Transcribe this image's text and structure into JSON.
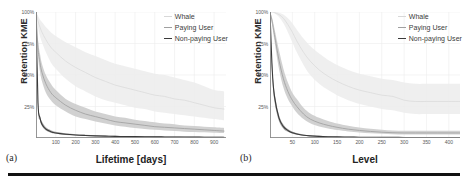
{
  "figure": {
    "background": "#ffffff",
    "rule_color": "#111111"
  },
  "panels": [
    {
      "tag": "(a)",
      "ylabel": "Retention KME",
      "xlabel": "Lifetime [days]"
    },
    {
      "tag": "(b)",
      "ylabel": "Retention KME",
      "xlabel": "Level"
    }
  ],
  "legend": {
    "items": [
      {
        "label": "Whale",
        "color": "#d8d8d8"
      },
      {
        "label": "Paying User",
        "color": "#a0a0a0"
      },
      {
        "label": "Non-paying User",
        "color": "#3a3a3a"
      }
    ]
  },
  "chart_data": [
    {
      "type": "line",
      "title": "",
      "panel": "(a)",
      "xlabel": "Lifetime [days]",
      "ylabel": "Retention KME",
      "xlim": [
        0,
        960
      ],
      "ylim": [
        0,
        100
      ],
      "xticks": [
        100,
        200,
        300,
        400,
        500,
        600,
        700,
        800,
        900
      ],
      "ytick_labels": [
        "100%",
        "75%",
        "50%",
        "25%"
      ],
      "yticks": [
        100,
        75,
        50,
        25
      ],
      "grid": true,
      "legend_position": "top-right",
      "x": [
        0,
        10,
        20,
        30,
        50,
        75,
        100,
        150,
        200,
        250,
        300,
        350,
        400,
        450,
        500,
        550,
        600,
        650,
        700,
        750,
        800,
        850,
        900,
        950
      ],
      "series": [
        {
          "name": "Whale",
          "color": "#d8d8d8",
          "band_color": "#ececec",
          "values": [
            100,
            93,
            88,
            84,
            78,
            72,
            68,
            61,
            56,
            52,
            48,
            45,
            42,
            40,
            38,
            36,
            34,
            33,
            31,
            30,
            28,
            26,
            24,
            23
          ],
          "band_upper": [
            100,
            97,
            94,
            92,
            88,
            84,
            81,
            76,
            72,
            68,
            65,
            62,
            59,
            57,
            55,
            53,
            51,
            50,
            48,
            46,
            44,
            41,
            38,
            37
          ],
          "band_lower": [
            100,
            88,
            81,
            76,
            68,
            60,
            55,
            47,
            41,
            37,
            33,
            30,
            28,
            26,
            24,
            23,
            21,
            20,
            19,
            18,
            17,
            16,
            15,
            14
          ]
        },
        {
          "name": "Paying User",
          "color": "#a0a0a0",
          "band_color": "#c9c9c9",
          "values": [
            100,
            72,
            60,
            52,
            43,
            36,
            32,
            26,
            22,
            19,
            17,
            15,
            13,
            12,
            11,
            10,
            9,
            8.5,
            8,
            7.5,
            7,
            6.5,
            6,
            5.5
          ],
          "band_upper": [
            100,
            78,
            67,
            59,
            50,
            43,
            38,
            31,
            27,
            24,
            21,
            19,
            17,
            16,
            14.5,
            13.5,
            12.5,
            11.5,
            11,
            10,
            9.5,
            9,
            8.5,
            8
          ],
          "band_lower": [
            100,
            66,
            53,
            45,
            36,
            30,
            26,
            21,
            17,
            15,
            13,
            11.5,
            10,
            9,
            8,
            7.2,
            6.5,
            6,
            5.5,
            5,
            4.8,
            4.5,
            4.2,
            4
          ]
        },
        {
          "name": "Non-paying User",
          "color": "#3a3a3a",
          "band_color": "#9a9a9a",
          "values": [
            100,
            28,
            16,
            11,
            7,
            5,
            4,
            3,
            2.4,
            2,
            1.7,
            1.5,
            1.3,
            1.2,
            1.1,
            1,
            0.9,
            0.85,
            0.8,
            0.75,
            0.7,
            0.65,
            0.6,
            0.55
          ],
          "band_upper": [
            100,
            31,
            18,
            13,
            8.5,
            6.2,
            5,
            3.8,
            3,
            2.6,
            2.2,
            2,
            1.8,
            1.6,
            1.5,
            1.4,
            1.3,
            1.2,
            1.1,
            1.05,
            1,
            0.95,
            0.9,
            0.85
          ],
          "band_lower": [
            100,
            25,
            14,
            9.5,
            6,
            4.2,
            3.3,
            2.4,
            1.9,
            1.6,
            1.35,
            1.2,
            1.05,
            0.95,
            0.85,
            0.8,
            0.72,
            0.68,
            0.62,
            0.58,
            0.54,
            0.5,
            0.46,
            0.42
          ]
        }
      ]
    },
    {
      "type": "line",
      "title": "",
      "panel": "(b)",
      "xlabel": "Level",
      "ylabel": "Retention KME",
      "xlim": [
        0,
        425
      ],
      "ylim": [
        0,
        100
      ],
      "xticks": [
        50,
        100,
        150,
        200,
        250,
        300,
        350,
        400
      ],
      "ytick_labels": [
        "100%",
        "75%",
        "50%",
        "25%"
      ],
      "yticks": [
        100,
        75,
        50,
        25
      ],
      "grid": true,
      "legend_position": "top-right",
      "x": [
        0,
        5,
        10,
        20,
        30,
        40,
        50,
        60,
        75,
        90,
        110,
        130,
        150,
        175,
        200,
        225,
        250,
        275,
        300,
        325,
        350,
        375,
        400,
        425
      ],
      "series": [
        {
          "name": "Whale",
          "color": "#d8d8d8",
          "band_color": "#ececec",
          "values": [
            100,
            100,
            99.5,
            98,
            95,
            90,
            84,
            77,
            68,
            61,
            54,
            49,
            45,
            41,
            38,
            36,
            34,
            33,
            30,
            29,
            29,
            29,
            29,
            29
          ],
          "band_upper": [
            100,
            100,
            100,
            99.5,
            98,
            95,
            91,
            86,
            79,
            73,
            67,
            62,
            58,
            54,
            51,
            49,
            47,
            46,
            44,
            43,
            43,
            43,
            43,
            43
          ],
          "band_lower": [
            100,
            100,
            99,
            96,
            91,
            84,
            76,
            68,
            58,
            50,
            43,
            38,
            34,
            30,
            27,
            25,
            23,
            22,
            20,
            19,
            19,
            19,
            19,
            19
          ]
        },
        {
          "name": "Paying User",
          "color": "#a0a0a0",
          "band_color": "#c9c9c9",
          "values": [
            100,
            92,
            82,
            62,
            47,
            37,
            30,
            25,
            19,
            15,
            12,
            10,
            8.5,
            7,
            6,
            5.2,
            4.6,
            4.2,
            4,
            4,
            4,
            4,
            4,
            4
          ],
          "band_upper": [
            100,
            95,
            87,
            70,
            55,
            44,
            36,
            31,
            24,
            19.5,
            16,
            13.5,
            11.5,
            9.7,
            8.4,
            7.4,
            6.6,
            6,
            5.7,
            5.7,
            5.7,
            5.7,
            5.7,
            5.7
          ],
          "band_lower": [
            100,
            89,
            77,
            55,
            40,
            31,
            25,
            20,
            15,
            11.8,
            9.2,
            7.6,
            6.3,
            5.2,
            4.4,
            3.8,
            3.3,
            3,
            2.8,
            2.8,
            2.8,
            2.8,
            2.8,
            2.8
          ]
        },
        {
          "name": "Non-paying User",
          "color": "#3a3a3a",
          "band_color": "#9a9a9a",
          "values": [
            100,
            54,
            33,
            16,
            9,
            6,
            4.2,
            3.2,
            2.2,
            1.7,
            1.3,
            1.05,
            0.9,
            0.75,
            0.65,
            0.58,
            0.52,
            0.48,
            0.45,
            0.45,
            0.45,
            0.45,
            0.45,
            0.45
          ],
          "band_upper": [
            100,
            58,
            37,
            18.5,
            10.8,
            7.2,
            5.2,
            4,
            2.8,
            2.2,
            1.7,
            1.4,
            1.2,
            1,
            0.88,
            0.78,
            0.7,
            0.65,
            0.6,
            0.6,
            0.6,
            0.6,
            0.6,
            0.6
          ],
          "band_lower": [
            100,
            50,
            29,
            13.5,
            7.4,
            4.9,
            3.4,
            2.5,
            1.7,
            1.3,
            0.98,
            0.8,
            0.66,
            0.55,
            0.47,
            0.42,
            0.37,
            0.34,
            0.32,
            0.32,
            0.32,
            0.32,
            0.32,
            0.32
          ]
        }
      ]
    }
  ]
}
